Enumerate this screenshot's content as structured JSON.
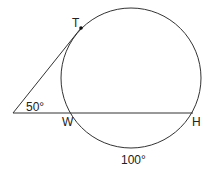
{
  "diagram": {
    "points": {
      "T": "T",
      "W": "W",
      "H": "H"
    },
    "angles": {
      "vertex_angle": "50°",
      "arc_WH": "100°"
    },
    "colors": {
      "stroke": "#333333",
      "background": "#ffffff"
    }
  }
}
